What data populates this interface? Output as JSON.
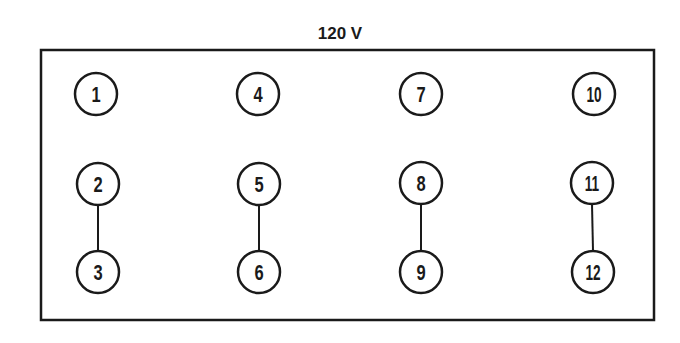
{
  "diagram": {
    "title": "120 V",
    "colors": {
      "stroke": "#1a1a1a",
      "background": "#ffffff"
    },
    "terminals": [
      {
        "id": "1",
        "label": "1",
        "cx": 96,
        "cy": 94
      },
      {
        "id": "2",
        "label": "2",
        "cx": 98,
        "cy": 184
      },
      {
        "id": "3",
        "label": "3",
        "cx": 98,
        "cy": 272
      },
      {
        "id": "4",
        "label": "4",
        "cx": 258,
        "cy": 94
      },
      {
        "id": "5",
        "label": "5",
        "cx": 259,
        "cy": 184
      },
      {
        "id": "6",
        "label": "6",
        "cx": 259,
        "cy": 272
      },
      {
        "id": "7",
        "label": "7",
        "cx": 421,
        "cy": 94
      },
      {
        "id": "8",
        "label": "8",
        "cx": 421,
        "cy": 183
      },
      {
        "id": "9",
        "label": "9",
        "cx": 421,
        "cy": 272
      },
      {
        "id": "10",
        "label": "10",
        "cx": 594,
        "cy": 94
      },
      {
        "id": "11",
        "label": "11",
        "cx": 592,
        "cy": 183
      },
      {
        "id": "12",
        "label": "12",
        "cx": 593,
        "cy": 272
      }
    ],
    "jumpers": [
      {
        "from": "2",
        "to": "3"
      },
      {
        "from": "5",
        "to": "6"
      },
      {
        "from": "8",
        "to": "9"
      },
      {
        "from": "11",
        "to": "12"
      }
    ]
  }
}
